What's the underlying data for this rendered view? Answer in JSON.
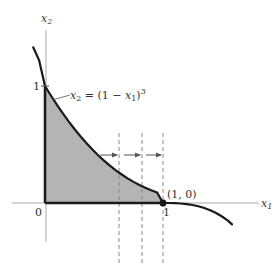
{
  "figure": {
    "axes": {
      "x_label": "x",
      "x_label_sub": "1",
      "y_label": "x",
      "y_label_sub": "2",
      "origin_label": "0",
      "x_tick_label": "1",
      "y_tick_label": "1"
    },
    "curve": {
      "equation_lhs": "x",
      "equation_lhs_sub": "2",
      "equation_eq": " = (1 − ",
      "equation_var": "x",
      "equation_var_sub": "1",
      "equation_close": ")",
      "equation_exp": "3"
    },
    "point": {
      "label": "(1, 0)"
    },
    "colors": {
      "shade": "#b4b4b4",
      "curve": "#1a1a1a",
      "axis": "#aaaaaa",
      "dash": "#888888"
    },
    "dashed_lines_count": 3,
    "arrows_count": 3
  }
}
